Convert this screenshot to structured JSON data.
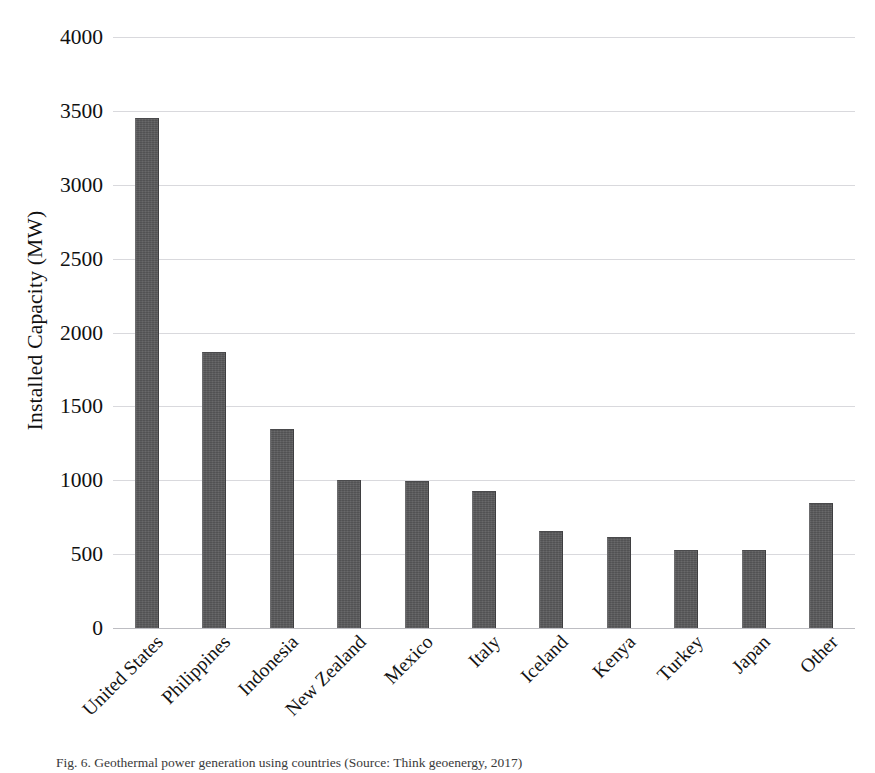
{
  "figure": {
    "caption": "Fig. 6. Geothermal power generation using countries (Source: Think geoenergy, 2017)"
  },
  "chart_data": {
    "type": "bar",
    "title": "",
    "xlabel": "",
    "ylabel": "Installed Capacity (MW)",
    "ylim": [
      0,
      4000
    ],
    "ytick_step": 500,
    "yticks": [
      "4000",
      "3500",
      "3000",
      "2500",
      "2000",
      "1500",
      "1000",
      "500",
      "0"
    ],
    "grid": true,
    "legend": "none",
    "bar_color": "#58585a",
    "gridline_color": "#d9d9dd",
    "categories": [
      "United States",
      "Philippines",
      "Indonesia",
      "New Zealand",
      "Mexico",
      "Italy",
      "Iceland",
      "Kenya",
      "Turkey",
      "Japan",
      "Other"
    ],
    "values": [
      3450,
      1865,
      1345,
      1005,
      995,
      930,
      660,
      615,
      530,
      530,
      845
    ]
  }
}
